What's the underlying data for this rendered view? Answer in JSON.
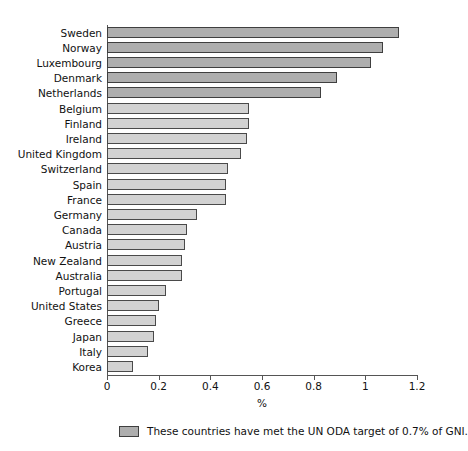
{
  "chart_data": {
    "type": "bar",
    "orientation": "horizontal",
    "title": "",
    "xlabel": "%",
    "ylabel": "",
    "xlim": [
      0,
      1.2
    ],
    "xticks": [
      "0",
      "0.2",
      "0.4",
      "0.6",
      "0.8",
      "1",
      "1.2"
    ],
    "xtick_values": [
      0,
      0.2,
      0.4,
      0.6,
      0.8,
      1,
      1.2
    ],
    "grid": false,
    "categories": [
      "Sweden",
      "Norway",
      "Luxembourg",
      "Denmark",
      "Netherlands",
      "Belgium",
      "Finland",
      "Ireland",
      "United Kingdom",
      "Switzerland",
      "Spain",
      "France",
      "Germany",
      "Canada",
      "Austria",
      "New Zealand",
      "Australia",
      "Portugal",
      "United States",
      "Greece",
      "Japan",
      "Italy",
      "Korea"
    ],
    "values": [
      1.13,
      1.07,
      1.02,
      0.89,
      0.83,
      0.55,
      0.55,
      0.54,
      0.52,
      0.47,
      0.46,
      0.46,
      0.35,
      0.31,
      0.3,
      0.29,
      0.29,
      0.23,
      0.2,
      0.19,
      0.18,
      0.16,
      0.1
    ],
    "highlight_flags": [
      true,
      true,
      true,
      true,
      true,
      false,
      false,
      false,
      false,
      false,
      false,
      false,
      false,
      false,
      false,
      false,
      false,
      false,
      false,
      false,
      false,
      false,
      false
    ],
    "colors": {
      "bar_default": "#d2d2d2",
      "bar_highlight": "#aeaeae",
      "bar_border": "#4a4a4a",
      "axis": "#555555",
      "text": "#111111",
      "background": "#ffffff"
    },
    "legend": {
      "position": "bottom",
      "entries": [
        {
          "swatch_color": "#aeaeae",
          "label": "These countries have met the UN ODA target of 0.7% of GNI."
        }
      ]
    }
  }
}
